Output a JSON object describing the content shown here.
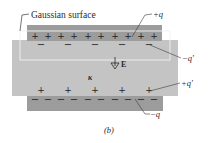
{
  "figure": {
    "caption": "(b)",
    "labels": {
      "gaussian_surface": "Gaussian surface",
      "plus_q": "+q",
      "minus_q_prime": "−q′",
      "plus_q_prime": "+q′",
      "minus_q": "−q",
      "field": "E",
      "dielectric_constant": "κ"
    },
    "top_plate_charges": [
      "+",
      "+",
      "+",
      "+",
      "+",
      "+",
      "+",
      "+",
      "+",
      "+"
    ],
    "dielectric_top_induced": [
      "−",
      "−",
      "−",
      "−",
      "−"
    ],
    "dielectric_bottom_induced": [
      "+",
      "+",
      "+",
      "+",
      "+"
    ],
    "bottom_plate_charges": [
      "−",
      "−",
      "−",
      "−",
      "−",
      "−",
      "−",
      "−",
      "−",
      "−"
    ],
    "colors": {
      "plate": "#9c9c9c",
      "dielectric": "#c4c4c4",
      "line": "#3a3a3a"
    }
  }
}
